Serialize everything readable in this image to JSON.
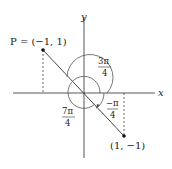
{
  "diagram": {
    "axes": {
      "x_label": "x",
      "y_label": "y"
    },
    "points": [
      {
        "name": "P",
        "label": "P = (−1, 1)",
        "coords": [
          -1,
          1
        ]
      },
      {
        "name": "Q",
        "label": "(1, −1)",
        "coords": [
          1,
          -1
        ]
      }
    ],
    "angles": [
      {
        "label_num": "3π",
        "label_den": "4",
        "description": "outer arc from positive x-axis counterclockwise to P"
      },
      {
        "label_num": "7π",
        "label_den": "4",
        "description": "inner arc counterclockwise to (1,-1)"
      },
      {
        "label_num": "−π",
        "label_den": "4",
        "description": "clockwise arc to (1,-1)"
      }
    ],
    "colors": {
      "line": "#333333",
      "background": "#ffffff"
    }
  }
}
